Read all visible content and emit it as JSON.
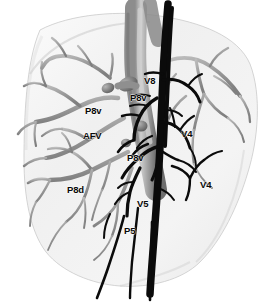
{
  "figure": {
    "width": 273,
    "height": 308,
    "background_color": "#ffffff",
    "modality": "3D volume rendering (grayscale)"
  },
  "organ": {
    "name": "liver-parenchyma",
    "description": "Translucent liver silhouette, right lobe view",
    "fill_color": "#f2f2f2",
    "edge_color": "#c9c9c9",
    "shadow_color": "#dcdcdc"
  },
  "structures": {
    "portal_system": {
      "name": "portal-vein-branches",
      "color": "#9b9b9b",
      "highlight_color": "#c4c4c4",
      "shade_color": "#6e6e6e"
    },
    "hepatic_veins": {
      "name": "hepatic-vein-branches",
      "color": "#0a0a0a"
    },
    "main_trunk": {
      "name": "main-portal-trunk",
      "color": "#a8a8a8"
    }
  },
  "labels": [
    {
      "id": "label-v8",
      "text": "V8",
      "x": 144,
      "y": 76,
      "structure": "hepatic-vein"
    },
    {
      "id": "label-p8v-upper",
      "text": "P8v",
      "x": 130,
      "y": 93,
      "structure": "portal-vein"
    },
    {
      "id": "label-p8v-left",
      "text": "P8v",
      "x": 85,
      "y": 106,
      "structure": "portal-vein"
    },
    {
      "id": "label-afv",
      "text": "AFV",
      "x": 83,
      "y": 131,
      "structure": "accessory-fissural-vein"
    },
    {
      "id": "label-p8v-mid",
      "text": "P8v",
      "x": 127,
      "y": 153,
      "structure": "portal-vein"
    },
    {
      "id": "label-v4-upper",
      "text": "V4",
      "x": 181,
      "y": 129,
      "structure": "hepatic-vein"
    },
    {
      "id": "label-v4-lower",
      "text": "V4",
      "x": 200,
      "y": 180,
      "structure": "hepatic-vein"
    },
    {
      "id": "label-p8d",
      "text": "P8d",
      "x": 67,
      "y": 185,
      "structure": "portal-vein"
    },
    {
      "id": "label-v5",
      "text": "V5",
      "x": 137,
      "y": 199,
      "structure": "hepatic-vein"
    },
    {
      "id": "label-p5",
      "text": "P5",
      "x": 124,
      "y": 226,
      "structure": "portal-vein"
    }
  ]
}
